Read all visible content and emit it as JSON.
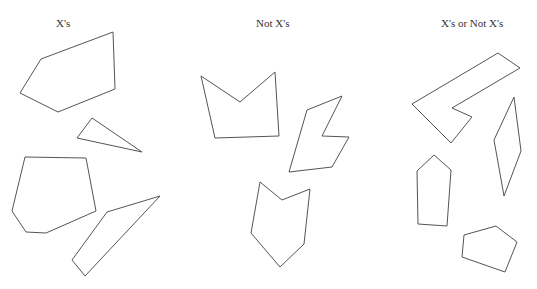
{
  "columns": [
    {
      "label": "X's",
      "label_x": 56,
      "shapes": [
        {
          "name": "pentagon-large",
          "points": "41,59 113,32 115,89 58,112 20,93"
        },
        {
          "name": "thin-triangle",
          "points": "92,118 142,152 77,138"
        },
        {
          "name": "hexagon",
          "points": "25,157 86,158 96,211 46,233 26,232 12,211"
        },
        {
          "name": "long-quadrilateral",
          "points": "107,212 160,196 85,276 72,260"
        }
      ]
    },
    {
      "label": "Not X's",
      "label_x": 256,
      "shapes": [
        {
          "name": "crown-shape",
          "points": "201,76 240,102 275,72 279,136 215,138"
        },
        {
          "name": "bolt-shape",
          "points": "307,110 342,96 322,136 349,137 332,167 289,172"
        },
        {
          "name": "chevron-shape",
          "points": "260,182 282,200 310,189 304,244 280,267 251,233"
        }
      ]
    },
    {
      "label": "X's or Not X's",
      "label_x": 441,
      "shapes": [
        {
          "name": "l-shape",
          "points": "498,53 520,68 452,108 472,117 451,143 412,104"
        },
        {
          "name": "kite-shape",
          "points": "514,97 521,151 504,196 494,140"
        },
        {
          "name": "house-shape",
          "points": "434,155 451,170 447,226 418,224 417,171"
        },
        {
          "name": "pentagon-small",
          "points": "464,235 496,226 517,242 505,272 462,257"
        }
      ]
    }
  ],
  "style": {
    "stroke": "#555555",
    "label_color": "#333333",
    "background": "#ffffff"
  }
}
